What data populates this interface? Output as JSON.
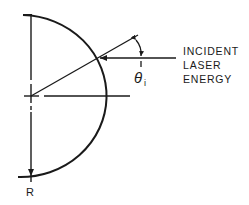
{
  "diagram": {
    "labels": {
      "incident_line1": "INCIDENT",
      "incident_line2": "LASER",
      "incident_line3": "ENERGY",
      "theta": "θ",
      "theta_subscript": "i",
      "radius": "R"
    },
    "colors": {
      "stroke": "#1a1a1a",
      "background": "#ffffff"
    }
  }
}
